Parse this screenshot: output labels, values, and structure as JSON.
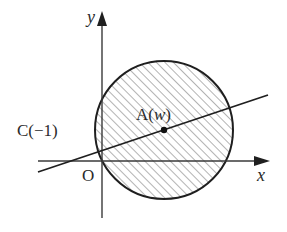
{
  "diagram": {
    "type": "complex-plane-figure",
    "axes": {
      "x_label": "x",
      "y_label": "y",
      "origin_label": "O"
    },
    "points": {
      "center": {
        "name": "A",
        "open": "(",
        "var": "w",
        "close": ")"
      },
      "line_point": {
        "label": "C(−1)"
      }
    },
    "circle": {
      "shaded": true,
      "hatch": "diagonal"
    },
    "line": {
      "through": [
        "C(−1)",
        "A(w)"
      ]
    },
    "colors": {
      "stroke": "#1f1f1f",
      "hatch": "#8a8a8a",
      "background": "#ffffff"
    }
  }
}
